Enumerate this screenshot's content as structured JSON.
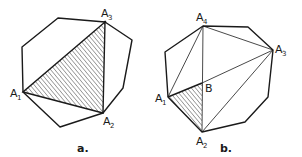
{
  "figures": [
    {
      "caption": "a.",
      "polygon": [
        [
          58,
          18
        ],
        [
          105,
          22
        ],
        [
          132,
          40
        ],
        [
          123,
          88
        ],
        [
          103,
          113
        ],
        [
          60,
          127
        ],
        [
          23,
          92
        ],
        [
          22,
          47
        ]
      ],
      "hatched_triangle": [
        [
          23,
          92
        ],
        [
          103,
          113
        ],
        [
          105,
          22
        ]
      ],
      "labels": [
        {
          "main": "A",
          "sub": "1",
          "x": 10,
          "y": 97
        },
        {
          "main": "A",
          "sub": "2",
          "x": 103,
          "y": 124
        },
        {
          "main": "A",
          "sub": "3",
          "x": 101,
          "y": 17
        }
      ]
    },
    {
      "caption": "b.",
      "polygon": [
        [
          203,
          26
        ],
        [
          248,
          27
        ],
        [
          273,
          50
        ],
        [
          268,
          97
        ],
        [
          245,
          122
        ],
        [
          202,
          132
        ],
        [
          168,
          97
        ],
        [
          165,
          52
        ]
      ],
      "hatched_triangle": [
        [
          168,
          97
        ],
        [
          202,
          83
        ],
        [
          202,
          132
        ]
      ],
      "diagonals": [
        [
          [
            203,
            26
          ],
          [
            168,
            97
          ]
        ],
        [
          [
            203,
            26
          ],
          [
            273,
            50
          ]
        ],
        [
          [
            203,
            26
          ],
          [
            202,
            132
          ]
        ],
        [
          [
            273,
            50
          ],
          [
            202,
            83
          ]
        ],
        [
          [
            273,
            50
          ],
          [
            202,
            132
          ]
        ]
      ],
      "labels": [
        {
          "main": "A",
          "sub": "1",
          "x": 155,
          "y": 102
        },
        {
          "main": "A",
          "sub": "2",
          "x": 196,
          "y": 146
        },
        {
          "main": "A",
          "sub": "3",
          "x": 275,
          "y": 53
        },
        {
          "main": "A",
          "sub": "4",
          "x": 196,
          "y": 21
        },
        {
          "main": "B",
          "sub": "",
          "x": 205,
          "y": 92
        }
      ]
    }
  ],
  "colors": {
    "stroke": "#1a1a1a",
    "hatch": "#2a2a2a",
    "background": "#ffffff"
  }
}
